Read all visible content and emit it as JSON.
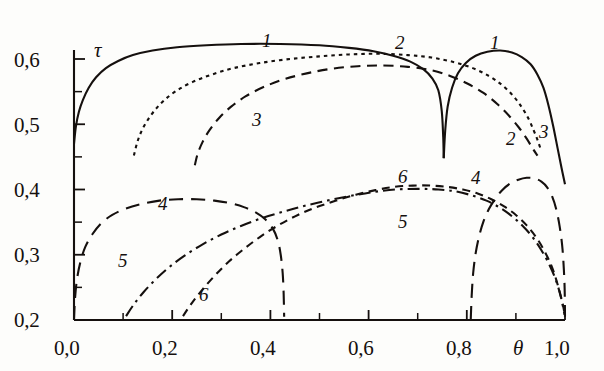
{
  "chart_data": {
    "type": "line",
    "title": "",
    "xlabel": "θ",
    "ylabel": "τ",
    "xlim": [
      0.0,
      1.0
    ],
    "ylim": [
      0.2,
      0.6
    ],
    "grid": false,
    "legend_position": "inline-curve-labels",
    "x_ticks_major": [
      "0,0",
      "0,2",
      "0,4",
      "0,6",
      "0,8",
      "1,0"
    ],
    "x_ticks_major_values": [
      0.0,
      0.2,
      0.4,
      0.6,
      0.8,
      1.0
    ],
    "x_ticks_minor_values": [
      0.1,
      0.3,
      0.5,
      0.7,
      0.9
    ],
    "y_ticks_major": [
      "0,2",
      "0,3",
      "0,4",
      "0,5",
      "0,6"
    ],
    "y_ticks_major_values": [
      0.2,
      0.3,
      0.4,
      0.5,
      0.6
    ],
    "y_ticks_minor_values": [
      0.25,
      0.35,
      0.45,
      0.55
    ],
    "series": [
      {
        "name": "1",
        "label": "1",
        "style": "solid",
        "branches": [
          {
            "points": [
              [
                0.0,
                0.47
              ],
              [
                0.004,
                0.497
              ],
              [
                0.01,
                0.519
              ],
              [
                0.018,
                0.537
              ],
              [
                0.03,
                0.556
              ],
              [
                0.045,
                0.572
              ],
              [
                0.065,
                0.586
              ],
              [
                0.09,
                0.597
              ],
              [
                0.12,
                0.606
              ],
              [
                0.16,
                0.613
              ],
              [
                0.21,
                0.618
              ],
              [
                0.27,
                0.621
              ],
              [
                0.34,
                0.623
              ],
              [
                0.42,
                0.623
              ],
              [
                0.5,
                0.621
              ],
              [
                0.56,
                0.617
              ],
              [
                0.61,
                0.612
              ],
              [
                0.65,
                0.605
              ],
              [
                0.685,
                0.596
              ],
              [
                0.712,
                0.584
              ],
              [
                0.73,
                0.57
              ],
              [
                0.742,
                0.552
              ],
              [
                0.749,
                0.52
              ],
              [
                0.752,
                0.48
              ],
              [
                0.753,
                0.448
              ]
            ]
          },
          {
            "points": [
              [
                0.753,
                0.448
              ],
              [
                0.756,
                0.49
              ],
              [
                0.761,
                0.527
              ],
              [
                0.77,
                0.556
              ],
              [
                0.782,
                0.578
              ],
              [
                0.798,
                0.594
              ],
              [
                0.818,
                0.605
              ],
              [
                0.842,
                0.611
              ],
              [
                0.868,
                0.613
              ],
              [
                0.892,
                0.61
              ],
              [
                0.912,
                0.603
              ],
              [
                0.93,
                0.592
              ],
              [
                0.944,
                0.576
              ],
              [
                0.956,
                0.556
              ],
              [
                0.966,
                0.53
              ],
              [
                0.976,
                0.497
              ],
              [
                0.985,
                0.463
              ],
              [
                0.993,
                0.433
              ],
              [
                1.0,
                0.408
              ]
            ]
          }
        ]
      },
      {
        "name": "2",
        "label": "2",
        "style": "dotted",
        "branches": [
          {
            "points": [
              [
                0.122,
                0.452
              ],
              [
                0.128,
                0.47
              ],
              [
                0.136,
                0.487
              ],
              [
                0.148,
                0.504
              ],
              [
                0.164,
                0.521
              ],
              [
                0.184,
                0.537
              ],
              [
                0.21,
                0.552
              ],
              [
                0.242,
                0.565
              ],
              [
                0.28,
                0.576
              ],
              [
                0.325,
                0.586
              ],
              [
                0.38,
                0.594
              ],
              [
                0.44,
                0.6
              ],
              [
                0.5,
                0.604
              ],
              [
                0.56,
                0.607
              ],
              [
                0.62,
                0.608
              ],
              [
                0.68,
                0.606
              ],
              [
                0.73,
                0.602
              ],
              [
                0.775,
                0.595
              ],
              [
                0.812,
                0.586
              ],
              [
                0.845,
                0.574
              ],
              [
                0.872,
                0.56
              ],
              [
                0.895,
                0.543
              ],
              [
                0.912,
                0.526
              ],
              [
                0.926,
                0.508
              ],
              [
                0.936,
                0.491
              ],
              [
                0.944,
                0.476
              ],
              [
                0.95,
                0.463
              ]
            ]
          }
        ]
      },
      {
        "name": "3",
        "label": "3",
        "style": "dashed",
        "branches": [
          {
            "points": [
              [
                0.246,
                0.437
              ],
              [
                0.252,
                0.455
              ],
              [
                0.262,
                0.473
              ],
              [
                0.276,
                0.491
              ],
              [
                0.296,
                0.51
              ],
              [
                0.32,
                0.527
              ],
              [
                0.35,
                0.543
              ],
              [
                0.386,
                0.557
              ],
              [
                0.428,
                0.569
              ],
              [
                0.474,
                0.578
              ],
              [
                0.524,
                0.585
              ],
              [
                0.578,
                0.589
              ],
              [
                0.63,
                0.59
              ],
              [
                0.68,
                0.588
              ],
              [
                0.726,
                0.583
              ],
              [
                0.766,
                0.574
              ],
              [
                0.802,
                0.562
              ],
              [
                0.834,
                0.548
              ],
              [
                0.862,
                0.531
              ],
              [
                0.886,
                0.513
              ],
              [
                0.906,
                0.495
              ],
              [
                0.922,
                0.478
              ],
              [
                0.934,
                0.463
              ],
              [
                0.944,
                0.452
              ]
            ]
          }
        ]
      },
      {
        "name": "4",
        "label": "4",
        "style": "longdash",
        "branches": [
          {
            "points": [
              [
                0.0,
                0.2
              ],
              [
                0.002,
                0.232
              ],
              [
                0.006,
                0.262
              ],
              [
                0.013,
                0.289
              ],
              [
                0.023,
                0.312
              ],
              [
                0.037,
                0.331
              ],
              [
                0.055,
                0.348
              ],
              [
                0.078,
                0.361
              ],
              [
                0.106,
                0.371
              ],
              [
                0.138,
                0.378
              ],
              [
                0.174,
                0.383
              ],
              [
                0.212,
                0.385
              ],
              [
                0.25,
                0.385
              ],
              [
                0.286,
                0.383
              ],
              [
                0.318,
                0.379
              ],
              [
                0.346,
                0.373
              ],
              [
                0.37,
                0.365
              ],
              [
                0.39,
                0.354
              ],
              [
                0.405,
                0.34
              ],
              [
                0.415,
                0.322
              ],
              [
                0.421,
                0.3
              ],
              [
                0.425,
                0.272
              ],
              [
                0.427,
                0.24
              ],
              [
                0.428,
                0.205
              ]
            ]
          },
          {
            "points": [
              [
                0.808,
                0.2
              ],
              [
                0.81,
                0.238
              ],
              [
                0.813,
                0.272
              ],
              [
                0.818,
                0.302
              ],
              [
                0.825,
                0.328
              ],
              [
                0.834,
                0.351
              ],
              [
                0.845,
                0.37
              ],
              [
                0.858,
                0.386
              ],
              [
                0.872,
                0.399
              ],
              [
                0.888,
                0.409
              ],
              [
                0.905,
                0.415
              ],
              [
                0.922,
                0.418
              ],
              [
                0.938,
                0.417
              ],
              [
                0.952,
                0.412
              ],
              [
                0.964,
                0.403
              ],
              [
                0.974,
                0.389
              ],
              [
                0.982,
                0.37
              ],
              [
                0.989,
                0.344
              ],
              [
                0.995,
                0.308
              ],
              [
                0.999,
                0.255
              ],
              [
                1.0,
                0.205
              ]
            ]
          }
        ]
      },
      {
        "name": "5",
        "label": "5",
        "style": "dashdot",
        "branches": [
          {
            "points": [
              [
                0.106,
                0.206
              ],
              [
                0.122,
                0.224
              ],
              [
                0.142,
                0.243
              ],
              [
                0.166,
                0.262
              ],
              [
                0.194,
                0.281
              ],
              [
                0.226,
                0.299
              ],
              [
                0.262,
                0.316
              ],
              [
                0.3,
                0.331
              ],
              [
                0.34,
                0.344
              ],
              [
                0.382,
                0.356
              ],
              [
                0.426,
                0.366
              ],
              [
                0.47,
                0.375
              ],
              [
                0.516,
                0.383
              ],
              [
                0.562,
                0.39
              ],
              [
                0.608,
                0.396
              ],
              [
                0.654,
                0.4
              ],
              [
                0.7,
                0.401
              ],
              [
                0.742,
                0.4
              ],
              [
                0.778,
                0.397
              ],
              [
                0.81,
                0.391
              ],
              [
                0.84,
                0.383
              ],
              [
                0.868,
                0.372
              ],
              [
                0.892,
                0.359
              ],
              [
                0.914,
                0.344
              ],
              [
                0.934,
                0.327
              ],
              [
                0.952,
                0.307
              ],
              [
                0.968,
                0.285
              ],
              [
                0.982,
                0.26
              ],
              [
                0.992,
                0.234
              ],
              [
                0.999,
                0.208
              ]
            ]
          }
        ]
      },
      {
        "name": "6",
        "label": "6",
        "style": "shortdash-steep",
        "branches": [
          {
            "points": [
              [
                0.222,
                0.206
              ],
              [
                0.24,
                0.226
              ],
              [
                0.262,
                0.247
              ],
              [
                0.288,
                0.269
              ],
              [
                0.316,
                0.29
              ],
              [
                0.348,
                0.31
              ],
              [
                0.382,
                0.329
              ],
              [
                0.418,
                0.346
              ],
              [
                0.456,
                0.361
              ],
              [
                0.494,
                0.373
              ],
              [
                0.534,
                0.383
              ],
              [
                0.574,
                0.392
              ],
              [
                0.614,
                0.399
              ],
              [
                0.652,
                0.404
              ],
              [
                0.69,
                0.406
              ],
              [
                0.726,
                0.406
              ],
              [
                0.76,
                0.404
              ],
              [
                0.792,
                0.4
              ],
              [
                0.822,
                0.394
              ],
              [
                0.85,
                0.385
              ],
              [
                0.876,
                0.374
              ],
              [
                0.9,
                0.361
              ],
              [
                0.922,
                0.345
              ],
              [
                0.942,
                0.326
              ],
              [
                0.96,
                0.303
              ],
              [
                0.975,
                0.278
              ],
              [
                0.987,
                0.249
              ],
              [
                0.996,
                0.222
              ],
              [
                1.0,
                0.205
              ]
            ]
          }
        ]
      }
    ],
    "curve_labels": [
      {
        "text": "1",
        "x_px": 262,
        "y_px": 30
      },
      {
        "text": "2",
        "x_px": 395,
        "y_px": 32
      },
      {
        "text": "1",
        "x_px": 490,
        "y_px": 32
      },
      {
        "text": "3",
        "x_px": 252,
        "y_px": 109
      },
      {
        "text": "2",
        "x_px": 506,
        "y_px": 128
      },
      {
        "text": "3",
        "x_px": 539,
        "y_px": 121
      },
      {
        "text": "4",
        "x_px": 158,
        "y_px": 193
      },
      {
        "text": "6",
        "x_px": 398,
        "y_px": 166
      },
      {
        "text": "4",
        "x_px": 471,
        "y_px": 167
      },
      {
        "text": "5",
        "x_px": 398,
        "y_px": 211
      },
      {
        "text": "5",
        "x_px": 118,
        "y_px": 250
      },
      {
        "text": "6",
        "x_px": 199,
        "y_px": 284
      }
    ]
  },
  "axes": {
    "y_axis_title": "τ",
    "x_axis_title": "θ",
    "y_labels": [
      "0,6",
      "0,5",
      "0,4",
      "0,3",
      "0,2"
    ],
    "x_labels": [
      "0,0",
      "0,2",
      "0,4",
      "0,6",
      "0,8",
      "1,0"
    ]
  },
  "colors": {
    "ink": "#15100e",
    "paper": "#fdfdfb"
  }
}
